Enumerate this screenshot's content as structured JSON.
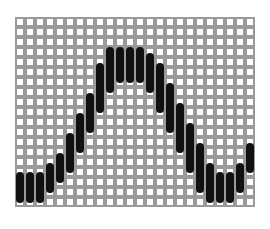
{
  "grid": {
    "columns": 24,
    "rows": 19,
    "cell_pitch": 10,
    "cell_border_color": "#9a9a9a",
    "bar_color": "#111111"
  },
  "bars": [
    {
      "col": 0,
      "row_start": 15.5,
      "row_end": 18.6
    },
    {
      "col": 1,
      "row_start": 15.5,
      "row_end": 18.6
    },
    {
      "col": 2,
      "row_start": 15.5,
      "row_end": 18.6
    },
    {
      "col": 3,
      "row_start": 14.6,
      "row_end": 17.6
    },
    {
      "col": 4,
      "row_start": 13.6,
      "row_end": 16.6
    },
    {
      "col": 5,
      "row_start": 11.6,
      "row_end": 15.6
    },
    {
      "col": 6,
      "row_start": 9.6,
      "row_end": 13.6
    },
    {
      "col": 7,
      "row_start": 7.6,
      "row_end": 11.6
    },
    {
      "col": 8,
      "row_start": 4.6,
      "row_end": 9.6
    },
    {
      "col": 9,
      "row_start": 3.0,
      "row_end": 7.6
    },
    {
      "col": 10,
      "row_start": 3.0,
      "row_end": 6.6
    },
    {
      "col": 11,
      "row_start": 3.0,
      "row_end": 6.6
    },
    {
      "col": 12,
      "row_start": 3.0,
      "row_end": 6.6
    },
    {
      "col": 13,
      "row_start": 3.6,
      "row_end": 7.6
    },
    {
      "col": 14,
      "row_start": 4.6,
      "row_end": 9.6
    },
    {
      "col": 15,
      "row_start": 6.6,
      "row_end": 11.6
    },
    {
      "col": 16,
      "row_start": 8.6,
      "row_end": 13.6
    },
    {
      "col": 17,
      "row_start": 10.6,
      "row_end": 15.6
    },
    {
      "col": 18,
      "row_start": 12.6,
      "row_end": 17.6
    },
    {
      "col": 19,
      "row_start": 14.6,
      "row_end": 18.6
    },
    {
      "col": 20,
      "row_start": 15.5,
      "row_end": 18.6
    },
    {
      "col": 21,
      "row_start": 15.5,
      "row_end": 18.6
    },
    {
      "col": 22,
      "row_start": 14.6,
      "row_end": 17.6
    },
    {
      "col": 23,
      "row_start": 12.6,
      "row_end": 15.6
    }
  ]
}
